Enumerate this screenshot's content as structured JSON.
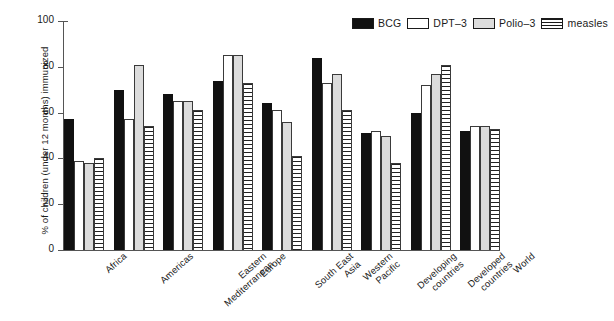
{
  "chart_data": {
    "type": "bar",
    "title": "",
    "xlabel": "",
    "ylabel": "% of children (under 12 months) immunized",
    "ylim": [
      0,
      100
    ],
    "yticks": [
      0,
      20,
      40,
      60,
      80,
      100
    ],
    "grid": false,
    "legend_position": "top-right",
    "categories": [
      "Africa",
      "Americas",
      "Eastern\nMediterranean",
      "Europe",
      "South East\nAsia",
      "Western\nPacific",
      "Developing\ncountries",
      "Developed\ncountries",
      "World"
    ],
    "series": [
      {
        "name": "BCG",
        "color": "#111111",
        "pattern": "solid-black",
        "values": [
          57,
          70,
          68,
          74,
          64,
          84,
          51,
          60,
          52
        ]
      },
      {
        "name": "DPT–3",
        "color": "#ffffff",
        "pattern": "open-white",
        "values": [
          39,
          57,
          65,
          85,
          61,
          73,
          52,
          72,
          54
        ]
      },
      {
        "name": "Polio–3",
        "color": "#dcdcdc",
        "pattern": "light-grey",
        "values": [
          38,
          81,
          65,
          85,
          56,
          77,
          50,
          77,
          54
        ]
      },
      {
        "name": "measles",
        "color": "#222222",
        "pattern": "horizontal-stripes",
        "values": [
          40,
          54,
          61,
          73,
          41,
          61,
          38,
          81,
          53
        ]
      }
    ]
  },
  "axis": {
    "y_title": "% of children (under 12 months) immunized",
    "y_tick_labels": [
      "0",
      "20",
      "40",
      "60",
      "80",
      "100"
    ]
  },
  "legend": {
    "entries": [
      {
        "label": "BCG",
        "swatch": "solid-black-swatch"
      },
      {
        "label": "DPT–3",
        "swatch": "open-white-swatch"
      },
      {
        "label": "Polio–3",
        "swatch": "light-grey-swatch"
      },
      {
        "label": "measles",
        "swatch": "striped-swatch"
      }
    ]
  }
}
